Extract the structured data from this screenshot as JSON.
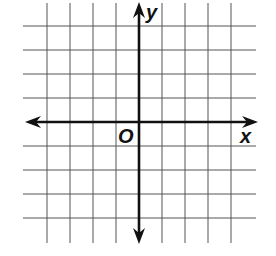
{
  "diagram": {
    "type": "coordinate-plane",
    "labels": {
      "x_axis": "x",
      "y_axis": "y",
      "origin": "O"
    },
    "grid": {
      "columns": 10,
      "rows": 10,
      "vertical_lines_x": [
        47,
        70,
        93,
        116,
        162,
        185,
        208,
        231
      ],
      "horizontal_lines_y": [
        26,
        50,
        74,
        98,
        146,
        170,
        194,
        218
      ],
      "grid_left": 23,
      "grid_right": 256,
      "grid_top": 3,
      "grid_bottom": 243
    },
    "axes": {
      "origin_x": 139,
      "origin_y": 122,
      "x_axis_from": 25,
      "x_axis_to": 258,
      "y_axis_from": 2,
      "y_axis_to": 244
    },
    "colors": {
      "grid": "#555555",
      "axis": "#111111",
      "background": "#ffffff"
    }
  }
}
